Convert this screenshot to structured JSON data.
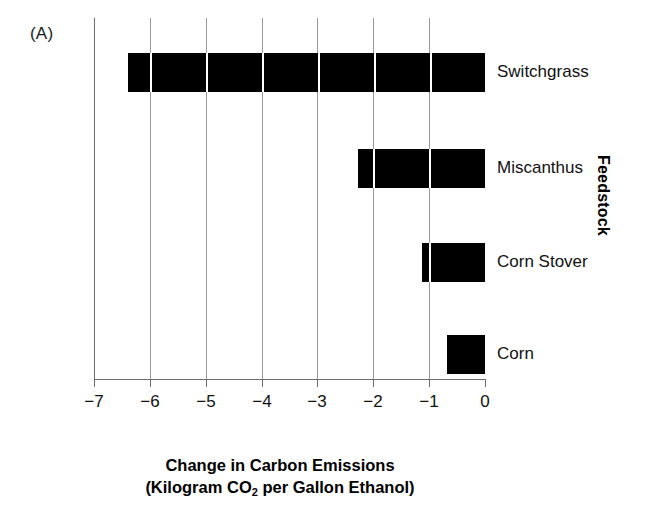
{
  "figure": {
    "panel_label": "(A)"
  },
  "chart_data": {
    "type": "bar",
    "orientation": "horizontal",
    "title": "",
    "xlabel_line1": "Change in Carbon Emissions",
    "xlabel_line2_prefix": "(Kilogram CO",
    "xlabel_line2_sub": "2",
    "xlabel_line2_suffix": " per Gallon Ethanol)",
    "ylabel": "Feedstock",
    "categories": [
      "Switchgrass",
      "Miscanthus",
      "Corn Stover",
      "Corn"
    ],
    "values": [
      -6.4,
      -2.27,
      -1.13,
      -0.68
    ],
    "xlim": [
      -7,
      0
    ],
    "xticks": [
      -7,
      -6,
      -5,
      -4,
      -3,
      -2,
      -1,
      0
    ],
    "xtick_labels": [
      "−7",
      "−6",
      "−5",
      "−4",
      "−3",
      "−2",
      "−1",
      "0"
    ],
    "grid": "vertical",
    "legend": "none",
    "bar_color": "#000000"
  }
}
